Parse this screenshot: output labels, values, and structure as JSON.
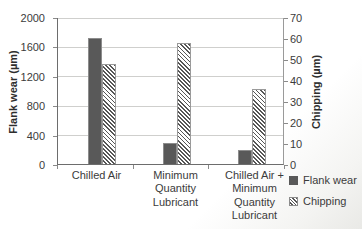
{
  "chart_data": {
    "type": "bar",
    "title": "",
    "categories": [
      "Chilled Air",
      "Minimum Quantity Lubricant",
      "Chilled Air + Minimum Quantity Lubricant"
    ],
    "series": [
      {
        "name": "Flank wear",
        "axis": "left",
        "style": "solid",
        "color": "#595959",
        "values": [
          1720,
          290,
          190
        ]
      },
      {
        "name": "Chipping",
        "axis": "right",
        "style": "hatched",
        "color": "#565656",
        "values": [
          48,
          58,
          36
        ]
      }
    ],
    "left_axis": {
      "label": "Flank wear (µm)",
      "min": 0,
      "max": 2000,
      "ticks": [
        2000,
        1600,
        1200,
        800,
        400,
        0
      ]
    },
    "right_axis": {
      "label": "Chipping (µm)",
      "min": 0,
      "max": 70,
      "ticks": [
        70,
        60,
        50,
        40,
        30,
        20,
        10,
        0
      ]
    },
    "grid": true,
    "legend_position": "bottom-right",
    "legend": [
      "Flank wear",
      "Chipping"
    ]
  },
  "colors": {
    "solid_bar": "#595959",
    "hatch_stripe": "#565656",
    "gridline": "#cfcfcd",
    "axis_line": "#6d6d6d",
    "text": "#3b3b3b",
    "background": "#ffffff"
  }
}
